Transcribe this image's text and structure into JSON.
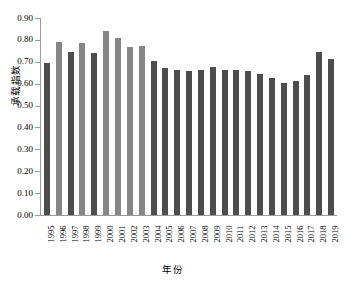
{
  "chart_data": {
    "type": "bar",
    "title": "",
    "xlabel": "年份",
    "ylabel": "承载指数",
    "ylim": [
      0.0,
      0.9
    ],
    "ytick_labels": [
      "0.90",
      "0.80",
      "0.70",
      "0.60",
      "0.50",
      "0.40",
      "0.30",
      "0.20",
      "0.10",
      "0.00"
    ],
    "ytick_values": [
      0.9,
      0.8,
      0.7,
      0.6,
      0.5,
      0.4,
      0.3,
      0.2,
      0.1,
      0.0
    ],
    "grid": false,
    "legend": "none",
    "categories": [
      "1995",
      "1996",
      "1997",
      "1998",
      "1999",
      "2000",
      "2001",
      "2002",
      "2003",
      "2004",
      "2005",
      "2006",
      "2007",
      "2008",
      "2009",
      "2010",
      "2011",
      "2012",
      "2013",
      "2014",
      "2015",
      "2016",
      "2017",
      "2018",
      "2019"
    ],
    "values": [
      0.695,
      0.79,
      0.745,
      0.785,
      0.74,
      0.84,
      0.808,
      0.768,
      0.772,
      0.705,
      0.67,
      0.662,
      0.66,
      0.662,
      0.678,
      0.662,
      0.663,
      0.66,
      0.645,
      0.628,
      0.602,
      0.613,
      0.64,
      0.745,
      0.715
    ],
    "bar_colors": [
      "#4d4d4d",
      "#868686",
      "#4d4d4d",
      "#868686",
      "#4d4d4d",
      "#868686",
      "#868686",
      "#868686",
      "#868686",
      "#4d4d4d",
      "#4d4d4d",
      "#4d4d4d",
      "#4d4d4d",
      "#4d4d4d",
      "#4d4d4d",
      "#4d4d4d",
      "#4d4d4d",
      "#4d4d4d",
      "#4d4d4d",
      "#4d4d4d",
      "#4d4d4d",
      "#4d4d4d",
      "#4d4d4d",
      "#4d4d4d",
      "#4d4d4d"
    ],
    "axis_color": "#9a9a9a"
  }
}
